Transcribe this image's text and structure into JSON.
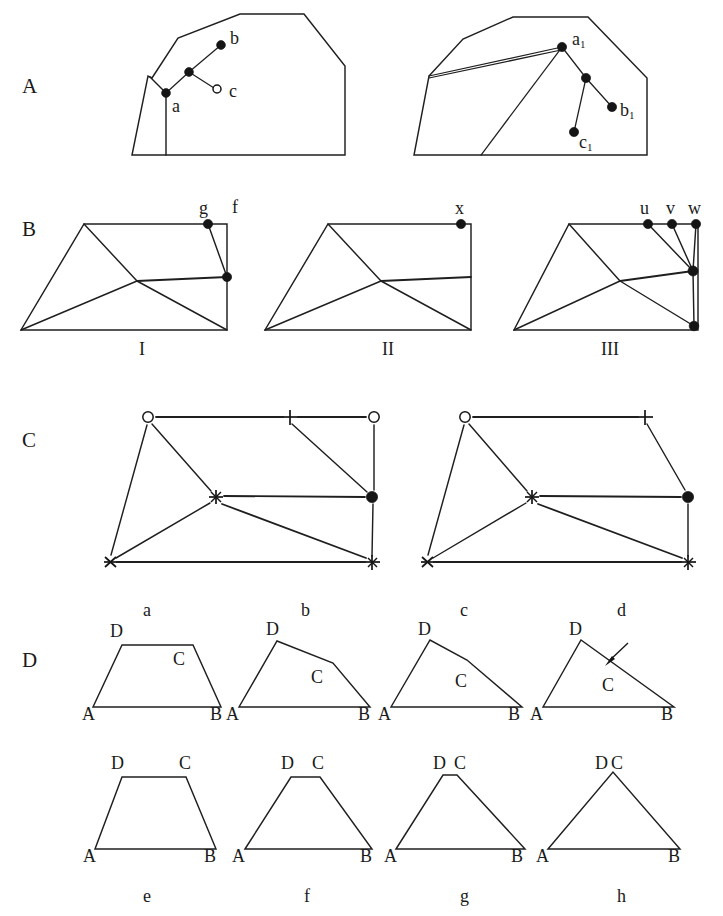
{
  "figure": {
    "background_color": "#ffffff",
    "line_color": "#1f1f1f",
    "node_color": "#151515",
    "width": 723,
    "height": 916
  },
  "panels": [
    {
      "letter": "A",
      "caption": "",
      "description": "Two polygon outlines with internal point trees",
      "subfigures": [
        {
          "id": "A-left",
          "vertex_labels": [
            "a",
            "b",
            "c"
          ],
          "node_styles": [
            "filled",
            "filled",
            "open"
          ]
        },
        {
          "id": "A-right",
          "vertex_labels": [
            "a1",
            "b1",
            "c1"
          ],
          "node_styles": [
            "filled",
            "filled",
            "filled"
          ]
        }
      ]
    },
    {
      "letter": "B",
      "caption": "",
      "description": "Three triangulated quadrilateral meshes labelled with roman numerals",
      "subfigures": [
        {
          "id": "B-I",
          "roman": "I",
          "vertex_labels": [
            "g",
            "f"
          ]
        },
        {
          "id": "B-II",
          "roman": "II",
          "vertex_labels": [
            "x"
          ]
        },
        {
          "id": "B-III",
          "roman": "III",
          "vertex_labels": [
            "u",
            "v",
            "w"
          ]
        }
      ]
    },
    {
      "letter": "C",
      "caption": "",
      "description": "Two node-marker graphs with differing edge sets",
      "subfigures": [
        {
          "id": "C-left",
          "markers": [
            "open-circle",
            "plus",
            "open-circle",
            "asterisk",
            "filled-circle",
            "cross",
            "filled-plus"
          ]
        },
        {
          "id": "C-right",
          "markers": [
            "open-circle",
            "plus",
            "asterisk",
            "filled-circle",
            "cross",
            "filled-plus"
          ]
        }
      ]
    },
    {
      "letter": "D",
      "caption": "",
      "description": "Eight quadrilaterals degenerating toward triangles, labelled a-h"
    }
  ],
  "panel_letters": [
    {
      "text": "A",
      "x": 22,
      "y": 76
    },
    {
      "text": "B",
      "x": 22,
      "y": 219
    },
    {
      "text": "C",
      "x": 22,
      "y": 430
    },
    {
      "text": "D",
      "x": 22,
      "y": 650
    }
  ],
  "panel_a": {
    "left": {
      "outline_points": "152,78 178,38 240,14 304,14 345,66 345,155 132,155 132,156 148,74",
      "outline_path": "M 152,78 L 178,38 L 240,14 L 304,14 L 345,66 L 345,155 L 132,155 L 148,76 Z",
      "inner_edge_path": "M 151,78 L 165,93",
      "vertical_edge_path": "M 165,93 L 165,155",
      "tree_edges": [
        "M 165,93 L 188,72",
        "M 188,72 L 221,45",
        "M 188,72 L 215,88"
      ],
      "nodes": [
        {
          "name": "point-a",
          "x": 165,
          "y": 93,
          "style": "filled",
          "r": 4.4
        },
        {
          "name": "point-branch",
          "x": 188,
          "y": 72,
          "style": "filled",
          "r": 4.4
        },
        {
          "name": "point-b",
          "x": 221,
          "y": 45,
          "style": "filled",
          "r": 4.4
        },
        {
          "name": "point-c",
          "x": 217,
          "y": 89,
          "style": "open",
          "r": 4.0
        }
      ],
      "labels": [
        {
          "text": "a",
          "x": 170,
          "y": 98
        },
        {
          "text": "b",
          "x": 229,
          "y": 31
        },
        {
          "text": "c",
          "x": 228,
          "y": 82
        }
      ]
    },
    "right": {
      "outline_path": "M 429,76 L 463,39 L 513,17 L 588,17 L 647,78 L 647,155 L 414,155 L 429,76 Z",
      "tree_edges": [
        "M 429,76 L 563,47",
        "M 429,76 L 561,49",
        "M 563,47 L 480,155",
        "M 563,47 L 586,78",
        "M 586,78 L 573,133",
        "M 586,78 L 613,108"
      ],
      "nodes": [
        {
          "name": "point-a1",
          "x": 563,
          "y": 47,
          "style": "filled",
          "r": 4.6
        },
        {
          "name": "point-branch1",
          "x": 586,
          "y": 78,
          "style": "filled",
          "r": 4.6
        },
        {
          "name": "point-b1",
          "x": 613,
          "y": 108,
          "style": "filled",
          "r": 4.6
        },
        {
          "name": "point-c1",
          "x": 573,
          "y": 133,
          "style": "filled",
          "r": 4.6
        }
      ],
      "labels": [
        {
          "text": "a",
          "sub": "1",
          "x": 572,
          "y": 33
        },
        {
          "text": "b",
          "sub": "1",
          "x": 621,
          "y": 102
        },
        {
          "text": "c",
          "sub": "1",
          "x": 578,
          "y": 134
        }
      ]
    }
  },
  "panel_b": {
    "subfigure_I": {
      "outline_path": "M 84,224 L 227,224 L 227,330 L 21,330 L 84,224 Z",
      "interior_edges": [
        "M 84,224 L 137,281",
        "M 137,281 L 21,330",
        "M 137,281 L 227,277",
        "M 137,281 L 227,330",
        "M 208,224 L 227,277"
      ],
      "nodes": [
        {
          "name": "node-g",
          "x": 208,
          "y": 224,
          "style": "filled",
          "r": 4.6
        },
        {
          "name": "node-f-lower",
          "x": 227,
          "y": 277,
          "style": "filled",
          "r": 4.6
        }
      ],
      "labels": [
        {
          "text": "g",
          "x": 199,
          "y": 201
        },
        {
          "text": "f",
          "x": 231,
          "y": 200
        }
      ],
      "roman": {
        "text": "I",
        "x": 139,
        "y": 342
      }
    },
    "subfigure_II": {
      "outline_path": "M 328,224 L 471,224 L 471,330 L 265,330 L 328,224 Z",
      "interior_edges": [
        "M 328,224 L 381,281",
        "M 381,281 L 265,330",
        "M 381,281 L 471,277",
        "M 381,281 L 471,330"
      ],
      "nodes": [
        {
          "name": "node-x",
          "x": 460,
          "y": 224,
          "style": "filled",
          "r": 4.6
        }
      ],
      "labels": [
        {
          "text": "x",
          "x": 455,
          "y": 201
        }
      ],
      "roman": {
        "text": "II",
        "x": 379,
        "y": 342
      }
    },
    "subfigure_III": {
      "outline_path": "M 569,224 L 698,224 L 698,330 L 514,330 L 569,224 Z",
      "interior_edges": [
        "M 569,224 L 620,281",
        "M 620,281 L 514,330",
        "M 620,281 L 694,272",
        "M 620,281 L 694,326",
        "M 648,224 L 694,272",
        "M 672,224 L 694,272",
        "M 698,224 L 694,272",
        "M 694,272 L 694,326"
      ],
      "nodes": [
        {
          "name": "node-u",
          "x": 648,
          "y": 224,
          "style": "filled",
          "r": 4.6
        },
        {
          "name": "node-v",
          "x": 672,
          "y": 224,
          "style": "filled",
          "r": 4.6
        },
        {
          "name": "node-w",
          "x": 696,
          "y": 224,
          "style": "filled",
          "r": 4.6
        },
        {
          "name": "node-junction",
          "x": 694,
          "y": 272,
          "style": "filled",
          "r": 5.0
        },
        {
          "name": "node-bottom-right",
          "x": 694,
          "y": 326,
          "style": "filled",
          "r": 4.8
        }
      ],
      "labels": [
        {
          "text": "u",
          "x": 640,
          "y": 201
        },
        {
          "text": "v",
          "x": 666,
          "y": 201
        },
        {
          "text": "w",
          "x": 689,
          "y": 201
        }
      ],
      "roman": {
        "text": "III",
        "x": 603,
        "y": 342
      }
    }
  },
  "panel_c": {
    "left": {
      "edges": [
        "M 148,417 L 290,417",
        "M 290,417 L 374,417",
        "M 148,417 L 110,562",
        "M 148,417 L 216,497",
        "M 290,417 L 371,497",
        "M 374,417 L 374,497",
        "M 216,497 L 371,497",
        "M 216,497 L 110,562",
        "M 216,497 L 371,562",
        "M 110,562 L 371,562",
        "M 374,497 L 372,562"
      ],
      "nodes": [
        {
          "name": "node-open-circle-top-left",
          "x": 148,
          "y": 417,
          "glyph": "open-circle"
        },
        {
          "name": "node-plus-top-middle",
          "x": 290,
          "y": 417,
          "glyph": "plus"
        },
        {
          "name": "node-open-circle-top-right",
          "x": 374,
          "y": 417,
          "glyph": "open-circle"
        },
        {
          "name": "node-asterisk-center",
          "x": 216,
          "y": 497,
          "glyph": "asterisk"
        },
        {
          "name": "node-filled-circle-right",
          "x": 372,
          "y": 497,
          "glyph": "filled-circle"
        },
        {
          "name": "node-cross-bottom-left",
          "x": 110,
          "y": 562,
          "glyph": "cross"
        },
        {
          "name": "node-filled-plus-bottom-right",
          "x": 372,
          "y": 562,
          "glyph": "filled-plus"
        }
      ]
    },
    "right": {
      "edges": [
        "M 465,417 L 645,417",
        "M 465,417 L 427,562",
        "M 465,417 L 532,497",
        "M 645,417 L 688,497",
        "M 532,497 L 688,497",
        "M 532,497 L 427,562",
        "M 532,497 L 688,562",
        "M 427,562 L 688,562",
        "M 688,497 L 688,562"
      ],
      "nodes": [
        {
          "name": "node-open-circle-top-left",
          "x": 465,
          "y": 417,
          "glyph": "open-circle"
        },
        {
          "name": "node-plus-top-right",
          "x": 645,
          "y": 417,
          "glyph": "plus"
        },
        {
          "name": "node-asterisk-center",
          "x": 532,
          "y": 497,
          "glyph": "asterisk"
        },
        {
          "name": "node-filled-circle-right",
          "x": 688,
          "y": 497,
          "glyph": "filled-circle"
        },
        {
          "name": "node-cross-bottom-left",
          "x": 427,
          "y": 562,
          "glyph": "cross"
        },
        {
          "name": "node-filled-plus-bottom-right",
          "x": 688,
          "y": 562,
          "glyph": "filled-plus"
        }
      ]
    },
    "sub_labels": [
      {
        "text": "a",
        "x": 143,
        "y": 600
      },
      {
        "text": "b",
        "x": 301,
        "y": 600
      },
      {
        "text": "c",
        "x": 460,
        "y": 600
      },
      {
        "text": "d",
        "x": 617,
        "y": 600
      }
    ]
  },
  "panel_d": {
    "row1": [
      {
        "id": "d-a",
        "label": "a",
        "label_pos": {
          "x": 143,
          "y": 609
        },
        "path": "M 93,707 L 122,645 L 193,645 L 221,707 Z",
        "vertex_labels": [
          {
            "text": "A",
            "x": 84,
            "y": 711
          },
          {
            "text": "B",
            "x": 212,
            "y": 711
          },
          {
            "text": "C",
            "x": 174,
            "y": 651
          },
          {
            "text": "D",
            "x": 111,
            "y": 626
          }
        ],
        "arrow": null
      },
      {
        "id": "d-b",
        "label": "b",
        "label_pos": {
          "x": 301,
          "y": 609
        },
        "path": "M 239,707 L 277,641 L 333,663 L 370,707 Z",
        "vertex_labels": [
          {
            "text": "A",
            "x": 228,
            "y": 711
          },
          {
            "text": "B",
            "x": 360,
            "y": 711
          },
          {
            "text": "C",
            "x": 313,
            "y": 671
          },
          {
            "text": "D",
            "x": 268,
            "y": 624
          }
        ],
        "arrow": null
      },
      {
        "id": "d-c",
        "label": "c",
        "label_pos": {
          "x": 460,
          "y": 609
        },
        "path": "M 391,707 L 430,640 L 467,659 L 522,707 Z",
        "vertex_labels": [
          {
            "text": "A",
            "x": 380,
            "y": 711
          },
          {
            "text": "B",
            "x": 512,
            "y": 711
          },
          {
            "text": "C",
            "x": 457,
            "y": 675
          },
          {
            "text": "D",
            "x": 420,
            "y": 624
          }
        ],
        "arrow": null
      },
      {
        "id": "d-d",
        "label": "d",
        "label_pos": {
          "x": 617,
          "y": 609
        },
        "path": "M 543,707 L 581,640 L 674,707 Z",
        "vertex_labels": [
          {
            "text": "A",
            "x": 532,
            "y": 711
          },
          {
            "text": "B",
            "x": 664,
            "y": 711
          },
          {
            "text": "C",
            "x": 605,
            "y": 680
          },
          {
            "text": "D",
            "x": 571,
            "y": 624
          }
        ],
        "arrow": {
          "tail_x": 626,
          "tail_y": 645,
          "head_x": 606,
          "head_y": 664
        }
      }
    ],
    "row2": [
      {
        "id": "d-e",
        "label": "e",
        "label_pos": {
          "x": 143,
          "y": 895
        },
        "path": "M 95,849 L 122,777 L 186,777 L 216,849 Z",
        "vertex_labels": [
          {
            "text": "A",
            "x": 85,
            "y": 853
          },
          {
            "text": "B",
            "x": 206,
            "y": 853
          },
          {
            "text": "C",
            "x": 181,
            "y": 757
          },
          {
            "text": "D",
            "x": 112,
            "y": 757
          }
        ]
      },
      {
        "id": "d-f",
        "label": "f",
        "label_pos": {
          "x": 306,
          "y": 895
        },
        "path": "M 245,849 L 291,777 L 320,777 L 372,849 Z",
        "vertex_labels": [
          {
            "text": "A",
            "x": 234,
            "y": 853
          },
          {
            "text": "B",
            "x": 362,
            "y": 853
          },
          {
            "text": "C",
            "x": 314,
            "y": 757
          },
          {
            "text": "D",
            "x": 283,
            "y": 757
          }
        ]
      },
      {
        "id": "d-g",
        "label": "g",
        "label_pos": {
          "x": 462,
          "y": 895
        },
        "path": "M 396,849 L 443,775 L 457,775 L 525,849 Z",
        "vertex_labels": [
          {
            "text": "A",
            "x": 386,
            "y": 853
          },
          {
            "text": "B",
            "x": 513,
            "y": 853
          },
          {
            "text": "C",
            "x": 456,
            "y": 757
          },
          {
            "text": "D",
            "x": 435,
            "y": 757
          }
        ]
      },
      {
        "id": "d-h",
        "label": "h",
        "label_pos": {
          "x": 617,
          "y": 895
        },
        "path": "M 548,849 L 613,772 L 680,849 Z",
        "vertex_labels": [
          {
            "text": "A",
            "x": 538,
            "y": 853
          },
          {
            "text": "B",
            "x": 670,
            "y": 853
          },
          {
            "text": "D",
            "x": 597,
            "y": 757
          },
          {
            "text": "C",
            "x": 612,
            "y": 757
          }
        ]
      }
    ]
  }
}
